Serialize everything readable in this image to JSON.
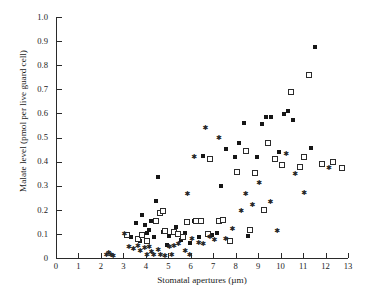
{
  "chart_data": {
    "type": "scatter",
    "title": "",
    "xlabel": "Stomatal apertures (µm)",
    "ylabel": "Malate level (pmol per live guard cell)",
    "xlim": [
      0,
      13
    ],
    "ylim": [
      0,
      1.0
    ],
    "xticks": [
      0,
      1,
      2,
      3,
      4,
      5,
      6,
      7,
      8,
      9,
      10,
      11,
      12,
      13
    ],
    "yticks": [
      0,
      0.1,
      0.2,
      0.3,
      0.4,
      0.5,
      0.6,
      0.7,
      0.8,
      0.9,
      1.0
    ],
    "xtick_labels": [
      "0",
      "1",
      "2",
      "3",
      "4",
      "5",
      "6",
      "7",
      "8",
      "9",
      "10",
      "11",
      "12",
      "13"
    ],
    "ytick_labels": [
      "0",
      "0.1",
      "0.2",
      "0.3",
      "0.4",
      "0.5",
      "0.6",
      "0.7",
      "0.8",
      "0.9",
      "1.0"
    ],
    "grid": false,
    "legend": false,
    "spines": [
      "left",
      "bottom"
    ],
    "tick_direction": "in",
    "series": [
      {
        "name": "filled-square",
        "marker": "filled-square",
        "color": "#161616",
        "points": [
          [
            3.55,
            0.145
          ],
          [
            3.95,
            0.135
          ],
          [
            4.05,
            0.105
          ],
          [
            4.15,
            0.118
          ],
          [
            4.35,
            0.088
          ],
          [
            4.45,
            0.238
          ],
          [
            4.55,
            0.335
          ],
          [
            4.75,
            0.108
          ],
          [
            3.35,
            0.088
          ],
          [
            3.75,
            0.072
          ],
          [
            5.05,
            0.093
          ],
          [
            5.35,
            0.128
          ],
          [
            5.55,
            0.075
          ],
          [
            5.75,
            0.105
          ],
          [
            6.15,
            0.152
          ],
          [
            6.35,
            0.088
          ],
          [
            6.55,
            0.425
          ],
          [
            6.95,
            0.095
          ],
          [
            7.15,
            0.102
          ],
          [
            7.35,
            0.298
          ],
          [
            7.55,
            0.452
          ],
          [
            7.95,
            0.418
          ],
          [
            8.15,
            0.478
          ],
          [
            8.35,
            0.562
          ],
          [
            8.55,
            0.092
          ],
          [
            8.95,
            0.418
          ],
          [
            9.15,
            0.555
          ],
          [
            9.35,
            0.585
          ],
          [
            9.55,
            0.585
          ],
          [
            9.95,
            0.438
          ],
          [
            10.15,
            0.598
          ],
          [
            10.35,
            0.612
          ],
          [
            10.55,
            0.572
          ],
          [
            11.35,
            0.455
          ],
          [
            11.55,
            0.875
          ],
          [
            5.95,
            0.062
          ],
          [
            4.95,
            0.052
          ],
          [
            4.25,
            0.152
          ],
          [
            3.85,
            0.178
          ]
        ]
      },
      {
        "name": "open-square",
        "marker": "open-square",
        "color": "#2b2b2b",
        "points": [
          [
            3.15,
            0.095
          ],
          [
            3.65,
            0.078
          ],
          [
            3.85,
            0.095
          ],
          [
            4.05,
            0.072
          ],
          [
            4.45,
            0.152
          ],
          [
            4.65,
            0.188
          ],
          [
            4.75,
            0.195
          ],
          [
            5.25,
            0.108
          ],
          [
            5.45,
            0.098
          ],
          [
            5.85,
            0.148
          ],
          [
            6.25,
            0.152
          ],
          [
            6.45,
            0.155
          ],
          [
            6.75,
            0.098
          ],
          [
            7.25,
            0.152
          ],
          [
            7.45,
            0.158
          ],
          [
            7.75,
            0.072
          ],
          [
            8.05,
            0.355
          ],
          [
            8.45,
            0.442
          ],
          [
            8.65,
            0.118
          ],
          [
            8.85,
            0.352
          ],
          [
            9.25,
            0.198
          ],
          [
            9.45,
            0.478
          ],
          [
            9.75,
            0.412
          ],
          [
            10.05,
            0.385
          ],
          [
            10.45,
            0.688
          ],
          [
            10.85,
            0.378
          ],
          [
            11.05,
            0.418
          ],
          [
            11.25,
            0.758
          ],
          [
            11.85,
            0.392
          ],
          [
            12.35,
            0.398
          ],
          [
            12.75,
            0.375
          ],
          [
            5.65,
            0.088
          ],
          [
            4.85,
            0.112
          ],
          [
            6.85,
            0.412
          ]
        ]
      },
      {
        "name": "star",
        "marker": "star",
        "color": "#252525",
        "points": [
          [
            2.25,
            0.012
          ],
          [
            2.35,
            0.018
          ],
          [
            2.45,
            0.012
          ],
          [
            2.55,
            0.008
          ],
          [
            3.05,
            0.098
          ],
          [
            3.25,
            0.042
          ],
          [
            3.45,
            0.035
          ],
          [
            3.65,
            0.048
          ],
          [
            3.75,
            0.028
          ],
          [
            3.95,
            0.038
          ],
          [
            4.05,
            0.012
          ],
          [
            4.15,
            0.045
          ],
          [
            4.25,
            0.022
          ],
          [
            4.35,
            0.012
          ],
          [
            4.55,
            0.032
          ],
          [
            4.65,
            0.012
          ],
          [
            4.85,
            0.008
          ],
          [
            5.05,
            0.042
          ],
          [
            5.15,
            0.012
          ],
          [
            5.25,
            0.048
          ],
          [
            5.45,
            0.058
          ],
          [
            5.75,
            0.028
          ],
          [
            5.95,
            0.012
          ],
          [
            6.05,
            0.075
          ],
          [
            6.35,
            0.062
          ],
          [
            6.55,
            0.058
          ],
          [
            6.85,
            0.085
          ],
          [
            7.05,
            0.072
          ],
          [
            7.55,
            0.075
          ],
          [
            7.85,
            0.118
          ],
          [
            8.25,
            0.195
          ],
          [
            8.45,
            0.262
          ],
          [
            8.75,
            0.218
          ],
          [
            9.05,
            0.308
          ],
          [
            9.55,
            0.232
          ],
          [
            9.85,
            0.112
          ],
          [
            10.25,
            0.428
          ],
          [
            10.65,
            0.348
          ],
          [
            11.05,
            0.268
          ],
          [
            12.15,
            0.372
          ],
          [
            7.25,
            0.495
          ],
          [
            6.65,
            0.538
          ],
          [
            5.85,
            0.262
          ],
          [
            6.15,
            0.415
          ]
        ]
      }
    ]
  }
}
